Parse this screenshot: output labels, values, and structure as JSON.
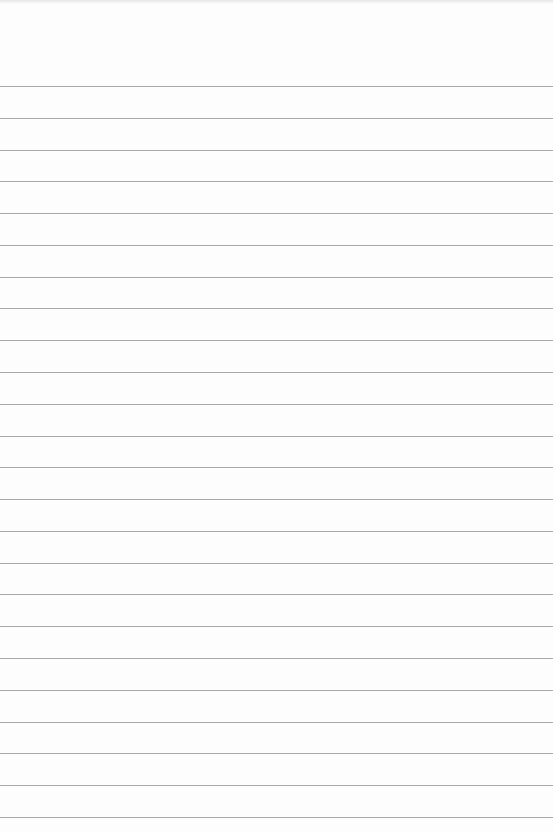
{
  "page": {
    "type": "ruled-notebook-page",
    "background_color": "#fdfdfd",
    "rule_color": "#a8a8a8",
    "rule_count": 24,
    "first_rule_y": 86,
    "rule_spacing": 31.78,
    "text": ""
  }
}
